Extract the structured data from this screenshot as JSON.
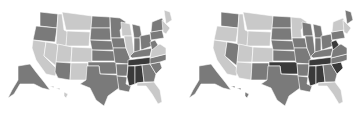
{
  "palette": {
    "light": "#c9c9c9",
    "medium": "#7a7a7a",
    "dark": "#3a3a3a",
    "background": "#ffffff"
  },
  "maps": [
    {
      "id": "left",
      "states": {
        "WA": "medium",
        "OR": "medium",
        "CA": "light",
        "NV": "light",
        "ID": "light",
        "MT": "light",
        "WY": "light",
        "UT": "light",
        "CO": "light",
        "AZ": "medium",
        "NM": "light",
        "ND": "medium",
        "SD": "medium",
        "NE": "medium",
        "KS": "medium",
        "OK": "medium",
        "TX": "medium",
        "MN": "medium",
        "IA": "medium",
        "MO": "medium",
        "AR": "medium",
        "LA": "medium",
        "WI": "light",
        "IL": "light",
        "MI": "medium",
        "IN": "medium",
        "OH": "medium",
        "KY": "medium",
        "TN": "dark",
        "MS": "dark",
        "AL": "dark",
        "GA": "medium",
        "FL": "light",
        "SC": "medium",
        "NC": "medium",
        "VA": "light",
        "WV": "medium",
        "PA": "medium",
        "NY": "medium",
        "ME": "light",
        "NE_REGION": "light",
        "AK": "medium",
        "HI": "light"
      }
    },
    {
      "id": "right",
      "states": {
        "WA": "medium",
        "OR": "light",
        "CA": "light",
        "NV": "medium",
        "ID": "light",
        "MT": "light",
        "WY": "light",
        "UT": "light",
        "CO": "light",
        "AZ": "light",
        "NM": "medium",
        "ND": "medium",
        "SD": "medium",
        "NE": "medium",
        "KS": "medium",
        "OK": "dark",
        "TX": "medium",
        "MN": "light",
        "IA": "medium",
        "MO": "medium",
        "AR": "medium",
        "LA": "medium",
        "WI": "medium",
        "IL": "medium",
        "MI": "medium",
        "IN": "medium",
        "OH": "medium",
        "KY": "medium",
        "TN": "dark",
        "MS": "dark",
        "AL": "dark",
        "GA": "medium",
        "FL": "light",
        "SC": "dark",
        "NC": "medium",
        "VA": "medium",
        "WV": "dark",
        "PA": "medium",
        "NY": "light",
        "ME": "medium",
        "NE_REGION": "light",
        "AK": "medium",
        "HI": "medium"
      }
    }
  ]
}
